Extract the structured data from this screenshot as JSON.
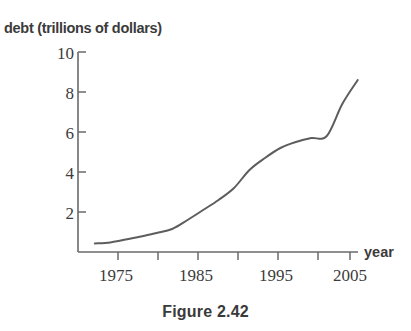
{
  "figure": {
    "caption": "Figure 2.42"
  },
  "chart_data": {
    "type": "line",
    "title": "",
    "subtitle": "",
    "xlabel": "year",
    "ylabel": "debt (trillions of dollars)",
    "ylabel_full": "debt (trillions of dollars)",
    "xlim": [
      1972,
      2006.5
    ],
    "ylim": [
      0,
      10
    ],
    "grid": false,
    "legend": "none",
    "y_ticks": [
      10,
      8,
      6,
      4,
      2
    ],
    "y_tick_labels": [
      "10",
      "8",
      "6",
      "4",
      "2"
    ],
    "x_ticks": [
      1975,
      1980,
      1985,
      1990,
      1995,
      2000,
      2005
    ],
    "x_tick_labels_shown": [
      "1975",
      "1985",
      "1995",
      "2005"
    ],
    "x_labeled_ticks": [
      1975,
      1985,
      1995,
      2005
    ],
    "x_minor_ticks": [
      1980,
      1990,
      2000
    ],
    "line_color": "#5d5d5d",
    "series": [
      {
        "name": "U.S. national debt",
        "x": [
          1972,
          1974,
          1976,
          1978,
          1980,
          1982,
          1984,
          1986,
          1988,
          1990,
          1992,
          1994,
          1996,
          1998,
          2000,
          2002,
          2004,
          2006
        ],
        "values": [
          0.43,
          0.48,
          0.62,
          0.78,
          0.95,
          1.15,
          1.6,
          2.1,
          2.6,
          3.2,
          4.1,
          4.7,
          5.2,
          5.5,
          5.7,
          5.8,
          7.4,
          8.6
        ]
      }
    ],
    "annotations": []
  }
}
